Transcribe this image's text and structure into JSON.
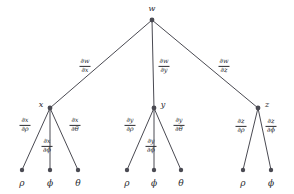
{
  "diagram": {
    "type": "tree",
    "colors": {
      "edge": "#4a4a52",
      "node": "#4a4a52",
      "text": "#2b2b30",
      "background": "#ffffff"
    },
    "nodes": [
      {
        "id": "w",
        "label": "w",
        "x": 152,
        "y": 20,
        "label_x": 152,
        "label_y": 9,
        "kind": "root"
      },
      {
        "id": "x",
        "label": "x",
        "x": 50,
        "y": 108,
        "label_x": 41,
        "label_y": 105,
        "kind": "branch"
      },
      {
        "id": "y",
        "label": "y",
        "x": 154,
        "y": 108,
        "label_x": 163,
        "label_y": 105,
        "kind": "branch"
      },
      {
        "id": "z",
        "label": "z",
        "x": 258,
        "y": 108,
        "label_x": 267,
        "label_y": 105,
        "kind": "branch"
      },
      {
        "id": "x-rho",
        "label": "ρ",
        "x": 22,
        "y": 170,
        "label_x": 22,
        "label_y": 183,
        "kind": "leaf"
      },
      {
        "id": "x-phi",
        "label": "ϕ",
        "x": 50,
        "y": 170,
        "label_x": 50,
        "label_y": 183,
        "kind": "leaf"
      },
      {
        "id": "x-theta",
        "label": "θ",
        "x": 78,
        "y": 170,
        "label_x": 78,
        "label_y": 183,
        "kind": "leaf"
      },
      {
        "id": "y-rho",
        "label": "ρ",
        "x": 127,
        "y": 170,
        "label_x": 127,
        "label_y": 183,
        "kind": "leaf"
      },
      {
        "id": "y-phi",
        "label": "ϕ",
        "x": 154,
        "y": 170,
        "label_x": 154,
        "label_y": 183,
        "kind": "leaf"
      },
      {
        "id": "y-theta",
        "label": "θ",
        "x": 181,
        "y": 170,
        "label_x": 181,
        "label_y": 183,
        "kind": "leaf"
      },
      {
        "id": "z-rho",
        "label": "ρ",
        "x": 243,
        "y": 170,
        "label_x": 243,
        "label_y": 183,
        "kind": "leaf"
      },
      {
        "id": "z-phi",
        "label": "ϕ",
        "x": 271,
        "y": 170,
        "label_x": 271,
        "label_y": 183,
        "kind": "leaf"
      }
    ],
    "edges": [
      {
        "id": "w-x",
        "from": "w",
        "to": "x"
      },
      {
        "id": "w-y",
        "from": "w",
        "to": "y"
      },
      {
        "id": "w-z",
        "from": "w",
        "to": "z"
      },
      {
        "id": "x-rho",
        "from": "x",
        "to": "x-rho"
      },
      {
        "id": "x-phi",
        "from": "x",
        "to": "x-phi"
      },
      {
        "id": "x-theta",
        "from": "x",
        "to": "x-theta"
      },
      {
        "id": "y-rho",
        "from": "y",
        "to": "y-rho"
      },
      {
        "id": "y-phi",
        "from": "y",
        "to": "y-phi"
      },
      {
        "id": "y-theta",
        "from": "y",
        "to": "y-theta"
      },
      {
        "id": "z-rho",
        "from": "z",
        "to": "z-rho"
      },
      {
        "id": "z-phi",
        "from": "z",
        "to": "z-phi"
      }
    ],
    "edge_labels": [
      {
        "id": "lbl-w-x",
        "edge": "w-x",
        "numerator": "∂w",
        "denominator": "∂x",
        "x": 85,
        "y": 66
      },
      {
        "id": "lbl-w-y",
        "edge": "w-y",
        "numerator": "∂w",
        "denominator": "∂y",
        "x": 164,
        "y": 66
      },
      {
        "id": "lbl-w-z",
        "edge": "w-z",
        "numerator": "∂w",
        "denominator": "∂z",
        "x": 224,
        "y": 66
      },
      {
        "id": "lbl-x-rho",
        "edge": "x-rho",
        "numerator": "∂x",
        "denominator": "∂ρ",
        "x": 25,
        "y": 125
      },
      {
        "id": "lbl-x-phi",
        "edge": "x-phi",
        "numerator": "∂x",
        "denominator": "∂ϕ",
        "x": 47,
        "y": 146
      },
      {
        "id": "lbl-x-theta",
        "edge": "x-theta",
        "numerator": "∂x",
        "denominator": "∂θ",
        "x": 75,
        "y": 125
      },
      {
        "id": "lbl-y-rho",
        "edge": "y-rho",
        "numerator": "∂y",
        "denominator": "∂ρ",
        "x": 130,
        "y": 125
      },
      {
        "id": "lbl-y-phi",
        "edge": "y-phi",
        "numerator": "∂y",
        "denominator": "∂ϕ",
        "x": 151,
        "y": 146
      },
      {
        "id": "lbl-y-theta",
        "edge": "y-theta",
        "numerator": "∂y",
        "denominator": "∂θ",
        "x": 179,
        "y": 125
      },
      {
        "id": "lbl-z-rho",
        "edge": "z-rho",
        "numerator": "∂z",
        "denominator": "∂ρ",
        "x": 241,
        "y": 126
      },
      {
        "id": "lbl-z-phi",
        "edge": "z-phi",
        "numerator": "∂z",
        "denominator": "∂ϕ",
        "x": 271,
        "y": 126
      }
    ]
  }
}
